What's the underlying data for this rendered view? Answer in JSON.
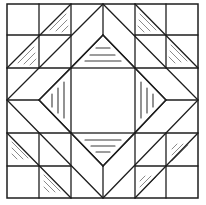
{
  "diagram": {
    "type": "quilt-block",
    "colors": {
      "background": "#ffffff",
      "outline": "#1e1e1e",
      "inner_hatch": "#3a3a3a",
      "corner_hatch": "#8a8a8a"
    },
    "grid": {
      "x": [
        7,
        39,
        71,
        103,
        135,
        166,
        198
      ],
      "y": [
        4,
        35,
        68,
        100,
        133,
        166,
        198
      ]
    },
    "outer_square": {
      "x1": 7,
      "y1": 4,
      "x2": 198,
      "y2": 198
    },
    "center_square": {
      "x1": 71,
      "y1": 68,
      "x2": 135,
      "y2": 133
    },
    "outer_diamond": [
      [
        103,
        4
      ],
      [
        198,
        100
      ],
      [
        103,
        198
      ],
      [
        7,
        100
      ]
    ],
    "inner_diamond": [
      [
        103,
        35
      ],
      [
        166,
        100
      ],
      [
        103,
        166
      ],
      [
        39,
        100
      ]
    ],
    "structure_lines": [
      [
        7,
        35,
        71,
        35
      ],
      [
        39,
        4,
        39,
        68
      ],
      [
        7,
        68,
        71,
        68
      ],
      [
        71,
        4,
        71,
        68
      ],
      [
        135,
        35,
        198,
        35
      ],
      [
        166,
        4,
        166,
        68
      ],
      [
        135,
        68,
        198,
        68
      ],
      [
        135,
        4,
        135,
        68
      ],
      [
        7,
        166,
        71,
        166
      ],
      [
        39,
        133,
        39,
        198
      ],
      [
        7,
        133,
        71,
        133
      ],
      [
        71,
        133,
        71,
        198
      ],
      [
        135,
        166,
        198,
        166
      ],
      [
        166,
        133,
        166,
        198
      ],
      [
        135,
        133,
        198,
        133
      ],
      [
        135,
        133,
        135,
        198
      ],
      [
        103,
        4,
        103,
        35
      ],
      [
        103,
        166,
        103,
        198
      ],
      [
        7,
        100,
        39,
        100
      ],
      [
        166,
        100,
        198,
        100
      ],
      [
        7,
        68,
        71,
        4
      ],
      [
        135,
        4,
        198,
        68
      ],
      [
        7,
        133,
        71,
        198
      ],
      [
        135,
        198,
        198,
        133
      ],
      [
        71,
        68,
        103,
        35
      ],
      [
        103,
        35,
        135,
        68
      ],
      [
        135,
        68,
        166,
        100
      ],
      [
        166,
        100,
        135,
        133
      ],
      [
        135,
        133,
        103,
        166
      ],
      [
        103,
        166,
        71,
        133
      ],
      [
        71,
        133,
        39,
        100
      ],
      [
        39,
        100,
        71,
        68
      ]
    ],
    "inner_hatching": [
      [
        96,
        48,
        110,
        48
      ],
      [
        90,
        55,
        115,
        55
      ],
      [
        85,
        61,
        121,
        61
      ],
      [
        85,
        140,
        121,
        140
      ],
      [
        91,
        146,
        115,
        146
      ],
      [
        96,
        152,
        110,
        152
      ],
      [
        52,
        94,
        52,
        107
      ],
      [
        58,
        88,
        58,
        113
      ],
      [
        64,
        82,
        64,
        118
      ],
      [
        141,
        82,
        141,
        118
      ],
      [
        147,
        88,
        147,
        113
      ],
      [
        153,
        94,
        153,
        107
      ]
    ],
    "corner_hatching": [
      [
        50,
        30,
        66,
        14
      ],
      [
        56,
        31,
        67,
        20
      ],
      [
        62,
        32,
        68,
        26
      ],
      [
        18,
        63,
        34,
        47
      ],
      [
        24,
        64,
        35,
        53
      ],
      [
        30,
        65,
        36,
        59
      ],
      [
        140,
        14,
        156,
        30
      ],
      [
        139,
        20,
        150,
        31
      ],
      [
        138,
        26,
        144,
        32
      ],
      [
        171,
        45,
        187,
        61
      ],
      [
        170,
        51,
        181,
        62
      ],
      [
        169,
        57,
        175,
        63
      ],
      [
        12,
        142,
        28,
        158
      ],
      [
        12,
        148,
        23,
        159
      ],
      [
        12,
        154,
        17,
        159
      ],
      [
        44,
        175,
        60,
        191
      ],
      [
        44,
        181,
        55,
        192
      ],
      [
        44,
        187,
        49,
        192
      ],
      [
        172,
        161,
        188,
        145
      ],
      [
        172,
        155,
        183,
        144
      ],
      [
        172,
        149,
        177,
        144
      ],
      [
        140,
        193,
        156,
        177
      ],
      [
        140,
        187,
        151,
        176
      ],
      [
        140,
        181,
        145,
        176
      ]
    ]
  }
}
